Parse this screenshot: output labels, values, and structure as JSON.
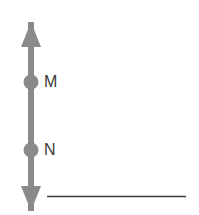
{
  "canvas": {
    "width": 199,
    "height": 215,
    "background_color": "#ffffff"
  },
  "figure": {
    "type": "geometry-line-diagram",
    "stroke_color": "#8a8a8a",
    "baseline_color": "#3c3c3c"
  },
  "arrow": {
    "name": "vertical-double-headed-arrow",
    "orientation": "vertical",
    "center_x": 31,
    "top_tip_y": 22,
    "bottom_tip_y": 211,
    "shaft_width": 6,
    "head_width": 20,
    "head_length": 25,
    "color": "#8a8a8a"
  },
  "points": [
    {
      "id": "point-m",
      "label": "M",
      "x": 31,
      "y": 82,
      "radius": 7.5,
      "dot_color": "#8a8a8a",
      "label_x": 44,
      "label_y": 82
    },
    {
      "id": "point-n",
      "label": "N",
      "x": 31,
      "y": 150,
      "radius": 7.5,
      "dot_color": "#8a8a8a",
      "label_x": 44,
      "label_y": 150
    }
  ],
  "baseline": {
    "name": "horizontal-line",
    "x_start": 47,
    "x_end": 186,
    "y": 196,
    "thickness": 1.6,
    "color": "#3c3c3c"
  }
}
